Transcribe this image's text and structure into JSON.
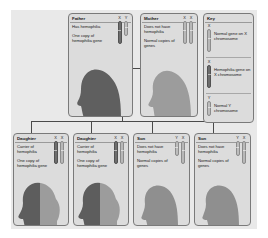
{
  "diagram": {
    "colors": {
      "canvas_background": "#e9e9e9",
      "card_background": "#dcdcdc",
      "card_border": "#7a7a7a",
      "connector_line": "#4a4a4a",
      "normal_chromosome": "#b8b8b8",
      "hemophilia_chromosome": "#6e6e6e",
      "silhouette_dark": "#5f5f5f",
      "silhouette_light": "#9c9c9c"
    }
  },
  "parents": [
    {
      "id": "father",
      "title": "Father",
      "lines": [
        "Has hemophilia",
        "One copy of hemophilia gene"
      ],
      "chromosomes": [
        {
          "label": "X",
          "type": "x-affected"
        },
        {
          "label": "Y",
          "type": "y"
        }
      ],
      "silhouette": "male-adult-dark"
    },
    {
      "id": "mother",
      "title": "Mother",
      "lines": [
        "Does not have hemophilia",
        "Normal copies of genes"
      ],
      "chromosomes": [
        {
          "label": "X",
          "type": "x"
        },
        {
          "label": "X",
          "type": "x"
        }
      ],
      "silhouette": "female-adult-light"
    }
  ],
  "children": [
    {
      "id": "daughter-1",
      "title": "Daughter",
      "lines": [
        "Carrier of hemophilia",
        "One copy of hemophilia gene"
      ],
      "chromosomes": [
        {
          "label": "X",
          "type": "x-affected"
        },
        {
          "label": "X",
          "type": "x"
        }
      ],
      "silhouette": "female-child-split"
    },
    {
      "id": "daughter-2",
      "title": "Daughter",
      "lines": [
        "Carrier of hemophilia",
        "One copy of hemophilia gene"
      ],
      "chromosomes": [
        {
          "label": "X",
          "type": "x-affected"
        },
        {
          "label": "X",
          "type": "x"
        }
      ],
      "silhouette": "female-child-split"
    },
    {
      "id": "son-1",
      "title": "Son",
      "lines": [
        "Does not have hemophilia",
        "Normal copies of genes"
      ],
      "chromosomes": [
        {
          "label": "Y",
          "type": "y"
        },
        {
          "label": "X",
          "type": "x"
        }
      ],
      "silhouette": "male-child-light"
    },
    {
      "id": "son-2",
      "title": "Son",
      "lines": [
        "Does not have hemophilia",
        "Normal copies of genes"
      ],
      "chromosomes": [
        {
          "label": "Y",
          "type": "y"
        },
        {
          "label": "X",
          "type": "x"
        }
      ],
      "silhouette": "male-child-light"
    }
  ],
  "key": {
    "title": "Key",
    "entries": [
      {
        "label": "X",
        "type": "x",
        "text": "Normal gene on X chromosome"
      },
      {
        "label": "X",
        "type": "x-affected",
        "text": "Hemophilia gene on X chromosome"
      },
      {
        "label": "Y",
        "type": "y",
        "text": "Normal Y chromosome"
      }
    ]
  }
}
